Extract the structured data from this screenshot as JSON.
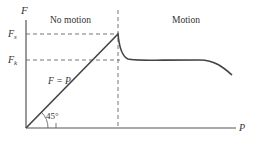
{
  "diagram": {
    "axes": {
      "y_label": "F",
      "x_label": "P"
    },
    "levels": {
      "static_label_main": "F",
      "static_label_sub": "s",
      "kinetic_label_main": "F",
      "kinetic_label_sub": "k"
    },
    "regions": {
      "left": "No motion",
      "right": "Motion"
    },
    "line_label": "F = P",
    "angle_label": "45°",
    "colors": {
      "curve": "#444444",
      "axis": "#555555",
      "dashed": "#666666",
      "text": "#333333"
    }
  }
}
